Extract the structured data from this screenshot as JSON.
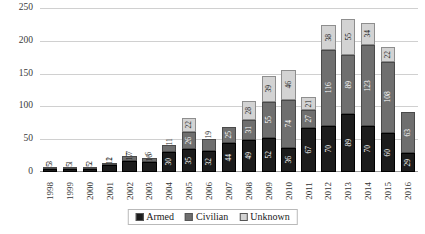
{
  "chart_data": {
    "type": "bar",
    "stacked": true,
    "title": "",
    "xlabel": "",
    "ylabel": "",
    "ylim": [
      0,
      250
    ],
    "yticks": [
      0,
      50,
      100,
      150,
      200,
      250
    ],
    "grid": true,
    "legend_position": "bottom",
    "categories": [
      "1998",
      "1999",
      "2000",
      "2001",
      "2002",
      "2003",
      "2004",
      "2005",
      "2006",
      "2007",
      "2008",
      "2009",
      "2010",
      "2011",
      "2012",
      "2013",
      "2014",
      "2015",
      "2016"
    ],
    "series": [
      {
        "name": "Armed",
        "color": "#1c1c1c",
        "values": [
          5,
          5,
          5,
          11,
          17,
          16,
          30,
          35,
          32,
          44,
          49,
          52,
          36,
          67,
          70,
          89,
          70,
          60,
          29
        ]
      },
      {
        "name": "Civilian",
        "color": "#6f6f6f",
        "values": [
          3,
          1,
          2,
          2,
          7,
          6,
          11,
          26,
          19,
          25,
          31,
          55,
          74,
          27,
          116,
          89,
          123,
          108,
          63
        ]
      },
      {
        "name": "Unknown",
        "color": "#d3d3d3",
        "values": [
          0,
          0,
          0,
          0,
          0,
          0,
          0,
          22,
          0,
          0,
          28,
          39,
          46,
          21,
          38,
          55,
          34,
          22,
          0
        ]
      }
    ],
    "legend": [
      {
        "label": "Armed",
        "color": "#1c1c1c"
      },
      {
        "label": "Civilian",
        "color": "#6f6f6f"
      },
      {
        "label": "Unknown",
        "color": "#d3d3d3"
      }
    ]
  }
}
